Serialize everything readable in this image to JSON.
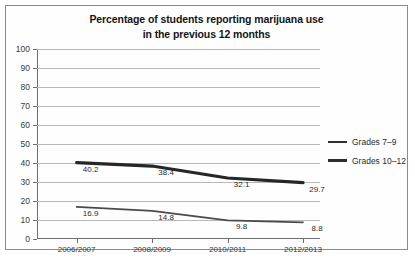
{
  "chart_data": {
    "type": "line",
    "title": "Percentage of students reporting marijuana use in the previous 12 months",
    "title_lines": [
      "Percentage of students reporting marijuana use",
      "in the previous 12 months"
    ],
    "categories": [
      "2006/2007",
      "2008/2009",
      "2010/2011",
      "2012/2013"
    ],
    "series": [
      {
        "name": "Grades 7–9",
        "values": [
          16.9,
          14.8,
          9.8,
          8.8
        ],
        "labels": [
          "16.9",
          "14.8",
          "9.8",
          "8.8"
        ],
        "color": "#4a4a4a",
        "line_width": 1.7
      },
      {
        "name": "Grades 10–12",
        "values": [
          40.2,
          38.4,
          32.1,
          29.7
        ],
        "labels": [
          "40.2",
          "38.4",
          "32.1",
          "29.7"
        ],
        "color": "#262626",
        "line_width": 3.2
      }
    ],
    "xlabel": "",
    "ylabel": "",
    "ylim": [
      0,
      100
    ],
    "y_ticks": [
      "0",
      "10",
      "20",
      "30",
      "40",
      "50",
      "60",
      "70",
      "80",
      "90",
      "100"
    ],
    "grid": true,
    "legend_position": "right"
  },
  "legend": {
    "entries": [
      {
        "label": "Grades 7–9",
        "style": "thin"
      },
      {
        "label": "Grades 10–12",
        "style": "thick"
      }
    ]
  }
}
